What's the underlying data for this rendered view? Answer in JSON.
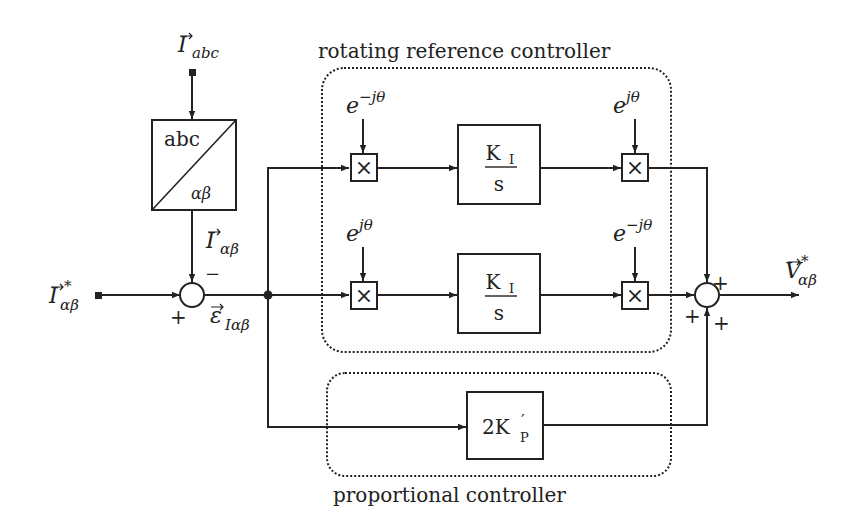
{
  "diagram": {
    "groups": {
      "rotating": {
        "label": "rotating reference controller"
      },
      "proportional": {
        "label": "proportional controller"
      }
    },
    "inputs": {
      "i_abc": {
        "base": "I",
        "sub": "abc"
      },
      "i_ref": {
        "base": "I",
        "sup": "*",
        "sub": "αβ"
      }
    },
    "transform_block": {
      "top": "abc",
      "bottom": "αβ"
    },
    "feedback_signal": {
      "base": "I",
      "sub": "αβ"
    },
    "error_signal": {
      "base": "ε",
      "sub": "Iαβ"
    },
    "summer_left": {
      "plus": "+",
      "minus": "−"
    },
    "summer_right": {
      "signs": [
        "+",
        "+",
        "+"
      ]
    },
    "rows": [
      {
        "mult_in_label": "e",
        "mult_in_exp": "−jθ",
        "gain_num": "K",
        "gain_num_sub": "I",
        "gain_den": "s",
        "mult_out_label": "e",
        "mult_out_exp": "jθ"
      },
      {
        "mult_in_label": "e",
        "mult_in_exp": "jθ",
        "gain_num": "K",
        "gain_num_sub": "I",
        "gain_den": "s",
        "mult_out_label": "e",
        "mult_out_exp": "−jθ"
      }
    ],
    "multiplier_symbol": "×",
    "proportional_gain": {
      "prefix": "2K",
      "prime": "′",
      "sub": "P"
    },
    "output": {
      "base": "V",
      "sup": "*",
      "sub": "αβ"
    }
  }
}
